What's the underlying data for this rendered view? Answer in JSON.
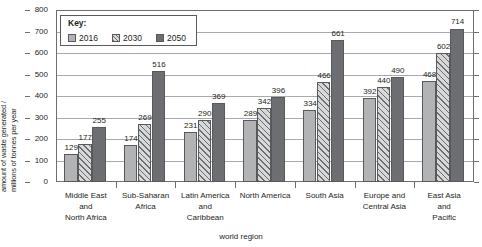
{
  "chart_data": {
    "type": "bar",
    "title": "",
    "xlabel": "world region",
    "ylabel": "amount of waste generated / millions of tonnes per year",
    "ylabel_line1": "amount of waste generated /",
    "ylabel_line2": "millions of tonnes per year",
    "ylim": [
      0,
      800
    ],
    "ytick_step": 100,
    "yticks": [
      "800",
      "700",
      "600",
      "500",
      "400",
      "300",
      "200",
      "100",
      "0"
    ],
    "grid": true,
    "legend_position": "top-left-inside",
    "legend_title": "Key:",
    "categories": [
      "Middle East and North Africa",
      "Sub-Saharan Africa",
      "Latin America and Caribbean",
      "North America",
      "South Asia",
      "Europe and Central Asia",
      "East Asia and Pacific"
    ],
    "category_lines": [
      [
        "Middle East",
        "and",
        "North Africa"
      ],
      [
        "Sub-Saharan",
        "Africa"
      ],
      [
        "Latin America",
        "and",
        "Caribbean"
      ],
      [
        "North America"
      ],
      [
        "South Asia"
      ],
      [
        "Europe and",
        "Central Asia"
      ],
      [
        "East Asia",
        "and",
        "Pacific"
      ]
    ],
    "series": [
      {
        "name": "2016",
        "color": "#b2b3b5",
        "fill": "solid-light-gray",
        "values": [
          129,
          174,
          231,
          289,
          334,
          392,
          468
        ]
      },
      {
        "name": "2030",
        "color": "#d7d8d9",
        "fill": "diagonal-hatch",
        "values": [
          177,
          269,
          290,
          342,
          466,
          440,
          602
        ]
      },
      {
        "name": "2050",
        "color": "#6d6e71",
        "fill": "solid-dark-gray",
        "values": [
          255,
          516,
          369,
          396,
          661,
          490,
          714
        ]
      }
    ]
  },
  "colors": {
    "series_2016": "#b2b3b5",
    "series_2030": "#d7d8d9",
    "series_2050": "#6d6e71",
    "axis": "#6d6e71",
    "gridline": "#a7a9ac",
    "text": "#231f20",
    "background": "#ffffff"
  }
}
